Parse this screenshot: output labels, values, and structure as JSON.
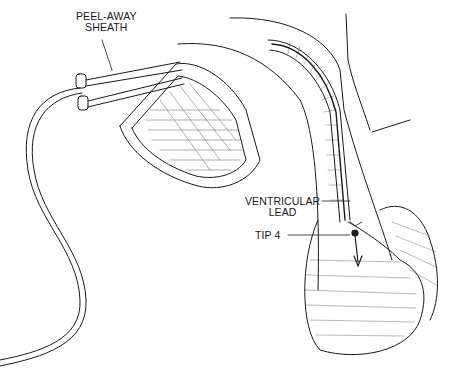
{
  "figure": {
    "type": "medical-illustration",
    "labels": {
      "sheath": [
        "PEEL-AWAY",
        "SHEATH"
      ],
      "lead": [
        "VENTRICULAR",
        "LEAD"
      ],
      "tip": "TIP 4"
    },
    "colors": {
      "ink": "#1a1a1a",
      "background": "#ffffff"
    }
  }
}
